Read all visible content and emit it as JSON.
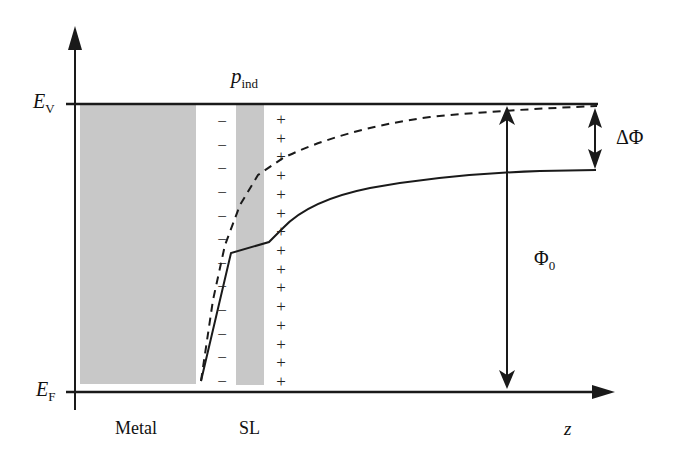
{
  "diagram": {
    "type": "energy-band diagram",
    "axes": {
      "y_axis": {
        "direction": "up"
      },
      "x_axis": {
        "label": "z",
        "direction": "right"
      }
    },
    "levels": {
      "vacuum": {
        "symbol": "E",
        "sub": "V"
      },
      "fermi": {
        "symbol": "E",
        "sub": "F"
      }
    },
    "regions": {
      "metal": {
        "label": "Metal",
        "fill": "#c8c8c8"
      },
      "spacer_layer": {
        "label": "SL",
        "fill": "#c8c8c8"
      }
    },
    "dipole_label": {
      "symbol": "p",
      "sub": "ind"
    },
    "work_function_initial": {
      "symbol": "Φ",
      "sub": "0"
    },
    "work_function_change": {
      "label": "ΔΦ"
    },
    "charges": {
      "negative_sign": "−",
      "positive_sign": "+",
      "negative_count": 12,
      "positive_count": 15
    },
    "curves": {
      "dashed": {
        "style": "dashed",
        "description": "potential without spacer layer"
      },
      "solid": {
        "style": "solid",
        "description": "potential with spacer layer"
      }
    },
    "colors": {
      "line": "#1a1a1a",
      "shade": "#c8c8c8"
    }
  }
}
